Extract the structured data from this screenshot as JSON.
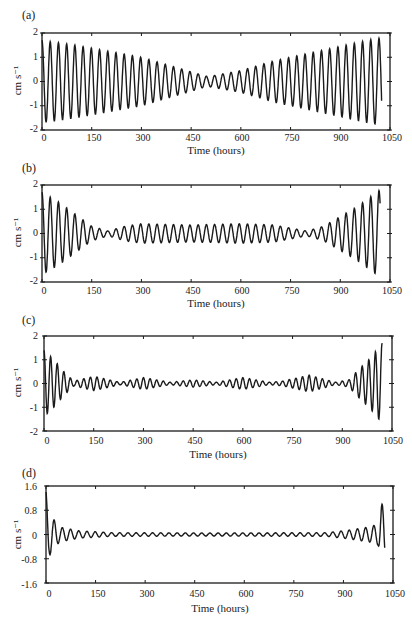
{
  "figure": {
    "panels": [
      {
        "id": "a",
        "label": "(a)",
        "ylabel": "cm s⁻¹",
        "xlabel": "Time (hours)",
        "yticks": [
          "2",
          "1",
          "0",
          "-1",
          "-2"
        ],
        "xticks": [
          "0",
          "150",
          "300",
          "450",
          "600",
          "750",
          "900",
          "1050"
        ]
      },
      {
        "id": "b",
        "label": "(b)",
        "ylabel": "cm s⁻¹",
        "xlabel": "Time (hours)",
        "yticks": [
          "2",
          "1",
          "0",
          "-1",
          "-2"
        ],
        "xticks": [
          "0",
          "150",
          "300",
          "450",
          "600",
          "750",
          "900",
          "1050"
        ]
      },
      {
        "id": "c",
        "label": "(c)",
        "ylabel": "cm s⁻¹",
        "xlabel": "Time (hours)",
        "yticks": [
          "2",
          "1",
          "0",
          "-1",
          "-2"
        ],
        "xticks": [
          "0",
          "150",
          "300",
          "450",
          "600",
          "750",
          "900",
          "1050"
        ]
      },
      {
        "id": "d",
        "label": "(d)",
        "ylabel": "cm s⁻¹",
        "xlabel": "Time (hours)",
        "yticks": [
          "1.6",
          "0.8",
          "0",
          "-0.8",
          "-1.6"
        ],
        "xticks": [
          "0",
          "150",
          "300",
          "450",
          "600",
          "750",
          "900",
          "1050"
        ]
      }
    ]
  },
  "chart_data": [
    {
      "type": "line",
      "title": "(a)",
      "xlabel": "Time (hours)",
      "ylabel": "cm s-1",
      "xlim": [
        0,
        1050
      ],
      "ylim": [
        -2,
        2
      ],
      "xticks": [
        0,
        150,
        300,
        450,
        600,
        750,
        900,
        1050
      ],
      "yticks": [
        -2,
        -1,
        0,
        1,
        2
      ],
      "grid": false,
      "description": "Oscillation (~24 h period) with amplitude decreasing linearly from ~1.7 at t=0 to ~0.2 near t=500, then increasing back to ~1.8 near t=1020",
      "envelope": {
        "t": [
          0,
          100,
          200,
          300,
          400,
          500,
          600,
          700,
          800,
          900,
          1000,
          1025
        ],
        "amplitude": [
          1.7,
          1.5,
          1.25,
          1.0,
          0.6,
          0.2,
          0.45,
          0.85,
          1.15,
          1.45,
          1.75,
          1.8
        ]
      },
      "period_hours": 24.8
    },
    {
      "type": "line",
      "title": "(b)",
      "xlabel": "Time (hours)",
      "ylabel": "cm s-1",
      "xlim": [
        0,
        1050
      ],
      "ylim": [
        -2,
        2
      ],
      "xticks": [
        0,
        150,
        300,
        450,
        600,
        750,
        900,
        1050
      ],
      "yticks": [
        -2,
        -1,
        0,
        1,
        2
      ],
      "grid": false,
      "description": "Large oscillation at start decaying by t≈150, small amplitude (~0.4) plateau between 250 and 750 with minima near 200 and 820, growing strongly after 850 to ~1.8 at t≈1020",
      "envelope": {
        "t": [
          0,
          50,
          100,
          150,
          200,
          250,
          300,
          450,
          600,
          700,
          800,
          850,
          900,
          950,
          1000,
          1020
        ],
        "amplitude": [
          1.7,
          1.3,
          0.8,
          0.3,
          0.1,
          0.3,
          0.4,
          0.35,
          0.4,
          0.35,
          0.1,
          0.3,
          0.7,
          1.1,
          1.6,
          1.8
        ]
      },
      "period_hours": 24.8
    },
    {
      "type": "line",
      "title": "(c)",
      "xlabel": "Time (hours)",
      "ylabel": "cm s-1",
      "xlim": [
        0,
        1050
      ],
      "ylim": [
        -2,
        2
      ],
      "xticks": [
        0,
        150,
        300,
        450,
        600,
        750,
        900,
        1050
      ],
      "yticks": [
        -2,
        -1,
        0,
        1,
        2
      ],
      "grid": false,
      "description": "Sharp oscillation at start (~±1.3) decaying by t≈80, then beating small-amplitude (~0.3) wave packets, growing to ~1.7 near t≈1020",
      "envelope": {
        "t": [
          0,
          30,
          60,
          90,
          150,
          230,
          300,
          380,
          450,
          520,
          600,
          680,
          720,
          800,
          880,
          920,
          950,
          980,
          1010,
          1020
        ],
        "amplitude": [
          1.4,
          1.0,
          0.5,
          0.1,
          0.3,
          0.05,
          0.25,
          0.05,
          0.15,
          0.05,
          0.25,
          0.05,
          0.1,
          0.35,
          0.05,
          0.15,
          0.6,
          1.0,
          1.5,
          1.7
        ]
      },
      "period_hours": 20
    },
    {
      "type": "line",
      "title": "(d)",
      "xlabel": "Time (hours)",
      "ylabel": "cm s-1",
      "xlim": [
        0,
        1050
      ],
      "ylim": [
        -1.6,
        1.6
      ],
      "xticks": [
        0,
        150,
        300,
        450,
        600,
        750,
        900,
        1050
      ],
      "yticks": [
        -1.6,
        -0.8,
        0,
        0.8,
        1.6
      ],
      "grid": false,
      "description": "Spike at start (~1.4 then -0.7) rapidly damped to near-zero small ripples (~0.05), small growth after 900 and a final spike to ~1.0 then -1.0 at t≈1020",
      "envelope": {
        "t": [
          0,
          10,
          40,
          100,
          200,
          500,
          850,
          920,
          980,
          1005,
          1015,
          1025
        ],
        "amplitude": [
          1.4,
          0.7,
          0.25,
          0.12,
          0.06,
          0.05,
          0.06,
          0.15,
          0.25,
          0.35,
          1.0,
          1.0
        ]
      },
      "period_hours": 24.8
    }
  ]
}
